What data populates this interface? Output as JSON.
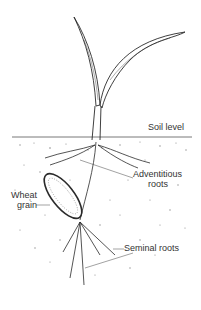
{
  "diagram": {
    "labels": {
      "soil_level": "Soil level",
      "adventitious_roots_1": "Adventitious",
      "adventitious_roots_2": "roots",
      "wheat_grain_1": "Wheat",
      "wheat_grain_2": "grain",
      "seminal_roots": "Seminal roots"
    },
    "colors": {
      "ink": "#2a2a2a",
      "soil_speckle": "#8a8a8a",
      "background": "#ffffff"
    }
  }
}
